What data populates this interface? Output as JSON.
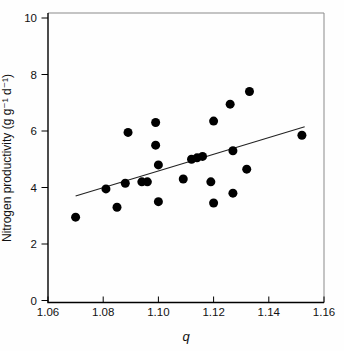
{
  "chart_data": {
    "type": "scatter",
    "title": "",
    "xlabel": "q",
    "ylabel": "Nitrogen productivity (g g⁻¹ d⁻¹)",
    "xlim": [
      1.06,
      1.16
    ],
    "ylim": [
      0,
      10
    ],
    "x_ticks": [
      1.06,
      1.08,
      1.1,
      1.12,
      1.14,
      1.16
    ],
    "x_tick_labels": [
      "1.06",
      "1.08",
      "1.10",
      "1.12",
      "1.14",
      "1.16"
    ],
    "y_ticks": [
      0,
      2,
      4,
      6,
      8,
      10
    ],
    "y_tick_labels": [
      "0",
      "2",
      "4",
      "6",
      "8",
      "10"
    ],
    "grid": false,
    "legend": null,
    "marker": {
      "shape": "circle",
      "color": "#000000",
      "radius": 4.5
    },
    "points": [
      [
        1.07,
        2.95
      ],
      [
        1.081,
        3.95
      ],
      [
        1.085,
        3.3
      ],
      [
        1.088,
        4.15
      ],
      [
        1.089,
        5.95
      ],
      [
        1.094,
        4.2
      ],
      [
        1.096,
        4.2
      ],
      [
        1.099,
        6.3
      ],
      [
        1.099,
        5.5
      ],
      [
        1.1,
        3.5
      ],
      [
        1.1,
        4.8
      ],
      [
        1.109,
        4.3
      ],
      [
        1.112,
        5.0
      ],
      [
        1.114,
        5.05
      ],
      [
        1.116,
        5.1
      ],
      [
        1.119,
        4.2
      ],
      [
        1.12,
        6.35
      ],
      [
        1.12,
        3.45
      ],
      [
        1.126,
        6.95
      ],
      [
        1.127,
        5.3
      ],
      [
        1.127,
        3.8
      ],
      [
        1.132,
        4.65
      ],
      [
        1.133,
        7.4
      ],
      [
        1.152,
        5.85
      ]
    ],
    "trendline": {
      "x1": 1.07,
      "y1": 3.7,
      "x2": 1.153,
      "y2": 6.15
    },
    "colors": {
      "points": "#000000",
      "trendline": "#222222",
      "axis": "#000000",
      "frame": "#8a8a8a"
    }
  }
}
